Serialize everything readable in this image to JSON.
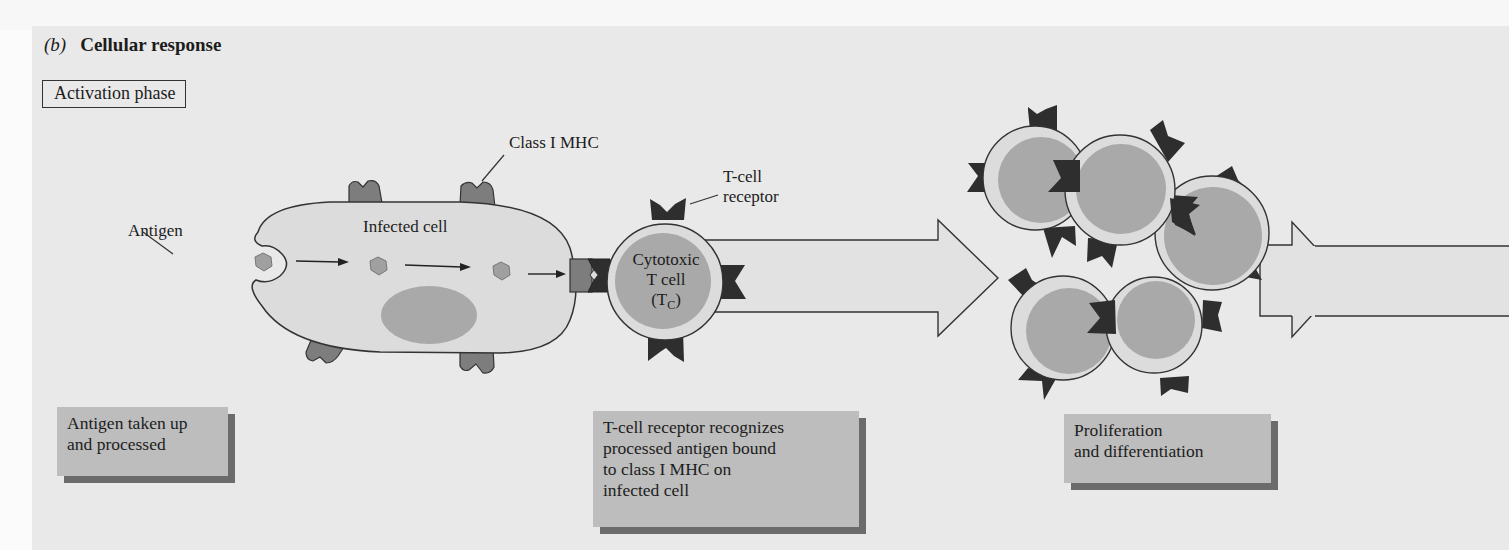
{
  "figure": {
    "panel_letter": "(b)",
    "title": "Cellular response",
    "phase_label": "Activation phase"
  },
  "labels": {
    "class_mhc": "Class I MHC",
    "tcr_line1": "T-cell",
    "tcr_line2": "receptor",
    "antigen": "Antigen",
    "infected_cell": "Infected cell",
    "tcell_line1": "Cytotoxic",
    "tcell_line2": "T cell",
    "tcell_line3_open": "(T",
    "tcell_sub": "C",
    "tcell_line3_close": ")"
  },
  "captions": [
    {
      "line1": "Antigen taken up",
      "line2": "and processed"
    },
    {
      "line1": "T-cell receptor recognizes",
      "line2": "processed antigen bound",
      "line3": "to class I MHC on",
      "line4": "infected cell"
    },
    {
      "line1": "Proliferation",
      "line2": "and differentiation"
    }
  ],
  "colors": {
    "panel_bg": "#e9e9e9",
    "cell_fill": "#dcdcdc",
    "nucleus": "#a9a9a9",
    "mhc": "#7d7d7d",
    "receptor": "#2e2e2e",
    "caption_bg": "#bdbdbd",
    "caption_shadow": "#6b6b6b"
  }
}
